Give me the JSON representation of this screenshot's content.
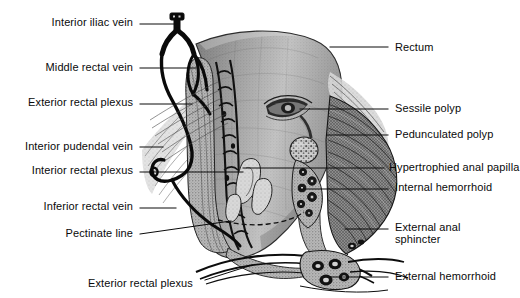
{
  "figure": {
    "type": "anatomical-illustration",
    "style": "grayscale engraving / halftone medical drawing",
    "background_color": "#ffffff",
    "ink_color": "#0a0a0a"
  },
  "labels_left": [
    {
      "id": "interior-iliac-vein",
      "text": "Interior iliac vein",
      "x": 133,
      "y": 27,
      "leader": [
        [
          140,
          24
        ],
        [
          175,
          24
        ],
        [
          175,
          18
        ]
      ]
    },
    {
      "id": "middle-rectal-vein",
      "text": "Middle rectal vein",
      "x": 133,
      "y": 72,
      "leader": [
        [
          140,
          68
        ],
        [
          196,
          68
        ]
      ]
    },
    {
      "id": "exterior-rectal-plexus-upper",
      "text": "Exterior rectal plexus",
      "x": 133,
      "y": 107,
      "leader": [
        [
          140,
          104
        ],
        [
          192,
          104
        ]
      ]
    },
    {
      "id": "interior-pudendal-vein",
      "text": "Interior pudendal vein",
      "x": 133,
      "y": 151,
      "leader": [
        [
          140,
          147
        ],
        [
          163,
          147
        ]
      ]
    },
    {
      "id": "interior-rectal-plexus",
      "text": "Interior rectal plexus",
      "x": 133,
      "y": 175,
      "leader": [
        [
          140,
          172
        ],
        [
          243,
          172
        ]
      ]
    },
    {
      "id": "inferior-rectal-vein",
      "text": "Inferior rectal vein",
      "x": 133,
      "y": 211,
      "leader": [
        [
          140,
          208
        ],
        [
          176,
          208
        ]
      ]
    },
    {
      "id": "pectinate-line",
      "text": "Pectinate line",
      "x": 133,
      "y": 238,
      "leader": [
        [
          140,
          234
        ],
        [
          231,
          221
        ]
      ]
    }
  ],
  "labels_right": [
    {
      "id": "rectum",
      "text": "Rectum",
      "x": 395,
      "y": 52,
      "leader": [
        [
          330,
          47
        ],
        [
          388,
          47
        ]
      ]
    },
    {
      "id": "sessile-polyp",
      "text": "Sessile polyp",
      "x": 395,
      "y": 113,
      "leader": [
        [
          300,
          109
        ],
        [
          388,
          109
        ]
      ]
    },
    {
      "id": "pedunculated-polyp",
      "text": "Pedunculated polyp",
      "x": 395,
      "y": 139,
      "leader": [
        [
          327,
          135
        ],
        [
          388,
          135
        ]
      ]
    },
    {
      "id": "hypertrophied-anal-papilla",
      "text": "Hypertrophied anal papilla",
      "x": 389,
      "y": 172,
      "leader": [
        [
          243,
          168
        ],
        [
          384,
          168
        ]
      ]
    },
    {
      "id": "internal-hemorrhoid",
      "text": "Internal hemorrhoid",
      "x": 395,
      "y": 192,
      "leader": [
        [
          300,
          189
        ],
        [
          388,
          189
        ]
      ]
    },
    {
      "id": "external-anal-sphincter",
      "text": "External anal\nsphincter",
      "x": 395,
      "y": 232,
      "leader": [
        [
          345,
          229
        ],
        [
          388,
          229
        ]
      ]
    },
    {
      "id": "external-hemorrhoid",
      "text": "External hemorrhoid",
      "x": 395,
      "y": 281,
      "leader": [
        [
          330,
          277
        ],
        [
          388,
          277
        ]
      ]
    }
  ],
  "labels_bottom": [
    {
      "id": "exterior-rectal-plexus-lower",
      "text": "Exterior rectal plexus",
      "x": 88,
      "y": 288,
      "leader": [
        [
          205,
          280
        ],
        [
          252,
          265
        ]
      ]
    }
  ],
  "anatomy_parts": [
    "interior iliac vein",
    "middle rectal vein",
    "exterior rectal plexus",
    "interior pudendal vein",
    "interior rectal plexus",
    "inferior rectal vein",
    "pectinate line",
    "rectum",
    "sessile polyp",
    "pedunculated polyp",
    "hypertrophied anal papilla",
    "internal hemorrhoid",
    "external anal sphincter",
    "external hemorrhoid"
  ]
}
